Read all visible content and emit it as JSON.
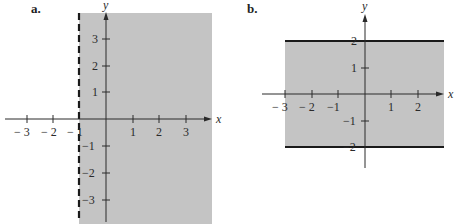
{
  "panels": [
    {
      "label": "a.",
      "description": "Region x > -1 shaded; boundary x = -1 dashed",
      "axis_labels": {
        "x": "x",
        "y": "y"
      },
      "x_ticks": [
        "− 3",
        "− 2",
        "− 1",
        "1",
        "2",
        "3"
      ],
      "y_ticks": [
        "3",
        "2",
        "1",
        "−1",
        "−2",
        "−3"
      ],
      "boundary": {
        "type": "vertical",
        "value": -1,
        "style": "dashed"
      },
      "shade_color": "#c4c4c4"
    },
    {
      "label": "b.",
      "description": "Region -2 <= y <= 2 shaded; boundaries y = 2 and y = -2 solid",
      "axis_labels": {
        "x": "x",
        "y": "y"
      },
      "x_ticks": [
        "− 3",
        "− 2",
        "−1",
        "1",
        "2"
      ],
      "y_ticks": [
        "2",
        "1",
        "−1",
        "−2"
      ],
      "boundary": [
        {
          "type": "horizontal",
          "value": 2,
          "style": "solid"
        },
        {
          "type": "horizontal",
          "value": -2,
          "style": "solid"
        }
      ],
      "shade_color": "#c4c4c4"
    }
  ]
}
